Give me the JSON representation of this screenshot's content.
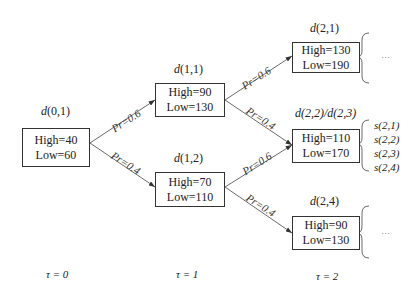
{
  "nodes": [
    {
      "id": "d01",
      "label_prefix": "d",
      "label_args": "(0,1)",
      "high": "High=40",
      "low": "Low=60"
    },
    {
      "id": "d11",
      "label_prefix": "d",
      "label_args": "(1,1)",
      "high": "High=90",
      "low": "Low=130"
    },
    {
      "id": "d12",
      "label_prefix": "d",
      "label_args": "(1,2)",
      "high": "High=70",
      "low": "Low=110"
    },
    {
      "id": "d21",
      "label_prefix": "d",
      "label_args": "(2,1)",
      "high": "High=130",
      "low": "Low=190"
    },
    {
      "id": "d22",
      "label": "d(2,2)/d(2,3)",
      "high": "High=110",
      "low": "Low=170"
    },
    {
      "id": "d24",
      "label_prefix": "d",
      "label_args": "(2,4)",
      "high": "High=90",
      "low": "Low=130"
    }
  ],
  "edges": [
    {
      "from": "d01",
      "to": "d11",
      "label": "Pr=0.6"
    },
    {
      "from": "d01",
      "to": "d12",
      "label": "Pr=0.4"
    },
    {
      "from": "d11",
      "to": "d21",
      "label": "Pr=0.6"
    },
    {
      "from": "d11",
      "to": "d22",
      "label": "Pr=0.4"
    },
    {
      "from": "d12",
      "to": "d22",
      "label": "Pr=0.6"
    },
    {
      "from": "d12",
      "to": "d24",
      "label": "Pr=0.4"
    }
  ],
  "scenarios": [
    "s(2,1)",
    "s(2,2)",
    "s(2,3)",
    "s(2,4)"
  ],
  "ellipsis": "···",
  "time_labels": [
    "τ = 0",
    "τ = 1",
    "τ = 2"
  ]
}
